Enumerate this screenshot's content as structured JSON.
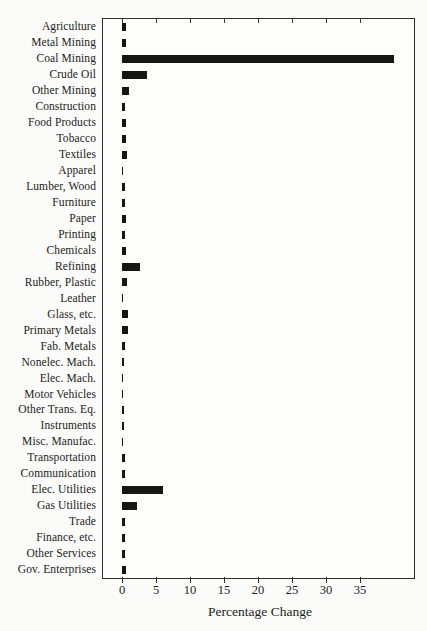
{
  "page": {
    "background_color": "#fbfbf9",
    "bar_color": "#161614",
    "axis_color": "#2e2e2c"
  },
  "chart_data": {
    "type": "bar",
    "orientation": "horizontal",
    "title": "",
    "xlabel": "Percentage Change",
    "ylabel": "",
    "categories": [
      "Agriculture",
      "Metal Mining",
      "Coal Mining",
      "Crude Oil",
      "Other Mining",
      "Construction",
      "Food Products",
      "Tobacco",
      "Textiles",
      "Apparel",
      "Lumber, Wood",
      "Furniture",
      "Paper",
      "Printing",
      "Chemicals",
      "Refining",
      "Rubber, Plastic",
      "Leather",
      "Glass, etc.",
      "Primary Metals",
      "Fab. Metals",
      "Nonelec. Mach.",
      "Elec. Mach.",
      "Motor Vehicles",
      "Other Trans. Eq.",
      "Instruments",
      "Misc. Manufac.",
      "Transportation",
      "Communication",
      "Elec. Utilities",
      "Gas Utilities",
      "Trade",
      "Finance, etc.",
      "Other Services",
      "Gov. Enterprises"
    ],
    "values": [
      0.6,
      0.6,
      40.0,
      3.7,
      1.0,
      0.4,
      0.6,
      0.6,
      0.8,
      0.1,
      0.4,
      0.4,
      0.6,
      0.4,
      0.6,
      2.7,
      0.8,
      0.1,
      0.9,
      0.9,
      0.4,
      0.3,
      0.2,
      0.2,
      0.3,
      0.3,
      0.15,
      0.5,
      0.4,
      6.0,
      2.2,
      0.4,
      0.4,
      0.4,
      0.6
    ],
    "x_ticks": [
      0,
      5,
      10,
      15,
      20,
      25,
      30,
      35
    ],
    "xlim": [
      -2.9,
      43
    ],
    "grid": false,
    "legend": null
  }
}
